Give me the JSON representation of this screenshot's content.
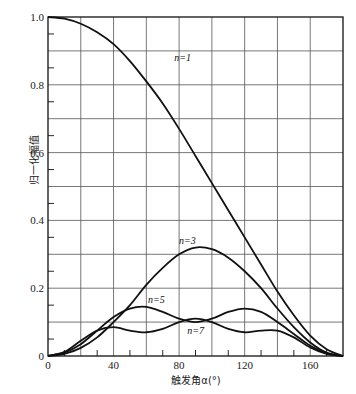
{
  "chart_data": {
    "type": "line",
    "title": "",
    "xlabel": "触发角α(°)",
    "ylabel": "归一化幅值",
    "xlim": [
      0,
      180
    ],
    "ylim": [
      0,
      1.0
    ],
    "x_ticks": [
      0,
      40,
      80,
      120,
      160
    ],
    "y_ticks": [
      0,
      0.2,
      0.4,
      0.6,
      0.8,
      1.0
    ],
    "y_tick_labels": [
      "0",
      "0.2",
      "0.4",
      "0.6",
      "0.8",
      "1.0"
    ],
    "x_tick_labels": [
      "0",
      "40",
      "80",
      "120",
      "160"
    ],
    "grid": true,
    "grid_x_step": 20,
    "grid_y_step": 0.1,
    "x": [
      0,
      10,
      20,
      30,
      40,
      50,
      60,
      70,
      80,
      90,
      100,
      110,
      120,
      130,
      140,
      150,
      160,
      170,
      180
    ],
    "series": [
      {
        "name": "n=1",
        "label_pos": [
          77,
          0.87
        ],
        "values": [
          1.0,
          0.995,
          0.98,
          0.955,
          0.92,
          0.87,
          0.81,
          0.745,
          0.67,
          0.59,
          0.51,
          0.43,
          0.35,
          0.27,
          0.19,
          0.12,
          0.06,
          0.02,
          0.0
        ]
      },
      {
        "name": "n=3",
        "label_pos": [
          80,
          0.33
        ],
        "values": [
          0.0,
          0.006,
          0.024,
          0.055,
          0.1,
          0.15,
          0.21,
          0.26,
          0.3,
          0.32,
          0.315,
          0.29,
          0.25,
          0.2,
          0.14,
          0.085,
          0.04,
          0.01,
          0.0
        ]
      },
      {
        "name": "n=5",
        "label_pos": [
          61,
          0.155
        ],
        "values": [
          0.0,
          0.01,
          0.035,
          0.075,
          0.115,
          0.14,
          0.145,
          0.13,
          0.11,
          0.1,
          0.11,
          0.13,
          0.14,
          0.13,
          0.1,
          0.065,
          0.03,
          0.008,
          0.0
        ]
      },
      {
        "name": "n=7",
        "label_pos": [
          85,
          0.065
        ],
        "values": [
          0.0,
          0.012,
          0.045,
          0.075,
          0.085,
          0.075,
          0.07,
          0.08,
          0.1,
          0.11,
          0.1,
          0.08,
          0.07,
          0.075,
          0.075,
          0.055,
          0.025,
          0.006,
          0.0
        ]
      }
    ]
  }
}
